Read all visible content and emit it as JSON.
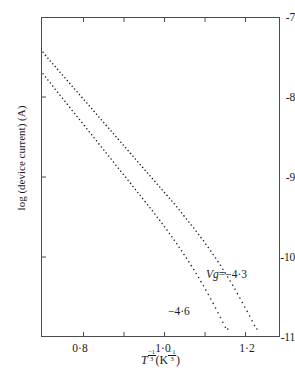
{
  "figure": {
    "background_color": "#ffffff",
    "ink_color": "#1a1a1a",
    "frame_color": "#4a4a4a"
  },
  "axes": {
    "y": {
      "title": "log (device current) (A)",
      "ticks": [
        "-7",
        "-8",
        "-9",
        "-10",
        "-11"
      ],
      "tick_values": [
        -7,
        -8,
        -9,
        -10,
        -11
      ],
      "limits": [
        -11,
        -7
      ]
    },
    "x": {
      "title_prefix": "T",
      "title_exp": "-1/3",
      "title_unit_open": "(K",
      "title_unit_exp": "-1/3",
      "title_unit_close": ")",
      "title_plain": "T^-1/3 (K^-1/3)",
      "ticks": [
        "0·8",
        "",
        "1·0",
        "",
        "1·2"
      ],
      "tick_values": [
        0.8,
        0.9,
        1.0,
        1.1,
        1.2
      ],
      "labeled": [
        true,
        false,
        true,
        false,
        true
      ],
      "limits": [
        0.695,
        1.285
      ]
    }
  },
  "annotations": [
    {
      "id": "vg43",
      "text": "Vg=−4·3",
      "var_part": "Vg",
      "rest": "=−4·3"
    },
    {
      "id": "vg46",
      "text": "−4·6",
      "var_part": "",
      "rest": "−4·6"
    }
  ],
  "chart_data": {
    "type": "scatter",
    "title": "",
    "xlabel": "T^-1/3 (K^-1/3)",
    "ylabel": "log (device current) (A)",
    "xlim": [
      0.695,
      1.285
    ],
    "ylim": [
      -11.0,
      -7.0
    ],
    "grid": false,
    "legend": "inline-annotations",
    "marker": "dot",
    "series": [
      {
        "name": "Vg=-4.3",
        "label": "Vg=−4·3",
        "comment": "upper-right curve; densely sampled dotted trace",
        "points": [
          [
            0.7,
            -7.44
          ],
          [
            0.706,
            -7.48
          ],
          [
            0.712,
            -7.515
          ],
          [
            0.718,
            -7.55
          ],
          [
            0.724,
            -7.585
          ],
          [
            0.73,
            -7.62
          ],
          [
            0.736,
            -7.655
          ],
          [
            0.742,
            -7.69
          ],
          [
            0.748,
            -7.725
          ],
          [
            0.754,
            -7.76
          ],
          [
            0.76,
            -7.795
          ],
          [
            0.766,
            -7.83
          ],
          [
            0.772,
            -7.865
          ],
          [
            0.778,
            -7.9
          ],
          [
            0.784,
            -7.935
          ],
          [
            0.79,
            -7.97
          ],
          [
            0.796,
            -8.005
          ],
          [
            0.802,
            -8.04
          ],
          [
            0.808,
            -8.075
          ],
          [
            0.814,
            -8.11
          ],
          [
            0.82,
            -8.145
          ],
          [
            0.826,
            -8.18
          ],
          [
            0.832,
            -8.215
          ],
          [
            0.838,
            -8.25
          ],
          [
            0.844,
            -8.285
          ],
          [
            0.85,
            -8.32
          ],
          [
            0.856,
            -8.355
          ],
          [
            0.862,
            -8.39
          ],
          [
            0.868,
            -8.425
          ],
          [
            0.874,
            -8.46
          ],
          [
            0.88,
            -8.495
          ],
          [
            0.886,
            -8.53
          ],
          [
            0.892,
            -8.565
          ],
          [
            0.898,
            -8.6
          ],
          [
            0.904,
            -8.635
          ],
          [
            0.91,
            -8.67
          ],
          [
            0.916,
            -8.705
          ],
          [
            0.922,
            -8.74
          ],
          [
            0.928,
            -8.775
          ],
          [
            0.934,
            -8.81
          ],
          [
            0.94,
            -8.845
          ],
          [
            0.946,
            -8.88
          ],
          [
            0.952,
            -8.915
          ],
          [
            0.958,
            -8.95
          ],
          [
            0.964,
            -8.985
          ],
          [
            0.97,
            -9.02
          ],
          [
            0.976,
            -9.055
          ],
          [
            0.982,
            -9.09
          ],
          [
            0.988,
            -9.125
          ],
          [
            0.994,
            -9.16
          ],
          [
            1.0,
            -9.195
          ],
          [
            1.006,
            -9.23
          ],
          [
            1.012,
            -9.265
          ],
          [
            1.018,
            -9.3
          ],
          [
            1.024,
            -9.335
          ],
          [
            1.03,
            -9.372
          ],
          [
            1.036,
            -9.41
          ],
          [
            1.042,
            -9.448
          ],
          [
            1.048,
            -9.486
          ],
          [
            1.054,
            -9.524
          ],
          [
            1.06,
            -9.562
          ],
          [
            1.066,
            -9.6
          ],
          [
            1.072,
            -9.638
          ],
          [
            1.078,
            -9.678
          ],
          [
            1.084,
            -9.718
          ],
          [
            1.09,
            -9.758
          ],
          [
            1.096,
            -9.798
          ],
          [
            1.102,
            -9.84
          ],
          [
            1.108,
            -9.882
          ],
          [
            1.114,
            -9.924
          ],
          [
            1.12,
            -9.968
          ],
          [
            1.126,
            -10.012
          ],
          [
            1.132,
            -10.058
          ],
          [
            1.138,
            -10.104
          ],
          [
            1.144,
            -10.152
          ],
          [
            1.15,
            -10.2
          ],
          [
            1.156,
            -10.25
          ],
          [
            1.162,
            -10.3
          ],
          [
            1.168,
            -10.352
          ],
          [
            1.174,
            -10.404
          ],
          [
            1.18,
            -10.458
          ],
          [
            1.186,
            -10.512
          ],
          [
            1.192,
            -10.568
          ],
          [
            1.198,
            -10.624
          ],
          [
            1.204,
            -10.68
          ],
          [
            1.21,
            -10.738
          ],
          [
            1.216,
            -10.796
          ],
          [
            1.222,
            -10.856
          ],
          [
            1.228,
            -10.9
          ]
        ]
      },
      {
        "name": "Vg=-4.6",
        "label": "−4·6",
        "comment": "lower-left curve; steeper, offset downward ~0.27 decades at left",
        "points": [
          [
            0.7,
            -7.71
          ],
          [
            0.706,
            -7.75
          ],
          [
            0.712,
            -7.788
          ],
          [
            0.718,
            -7.826
          ],
          [
            0.724,
            -7.864
          ],
          [
            0.73,
            -7.902
          ],
          [
            0.736,
            -7.94
          ],
          [
            0.742,
            -7.978
          ],
          [
            0.748,
            -8.016
          ],
          [
            0.754,
            -8.054
          ],
          [
            0.76,
            -8.092
          ],
          [
            0.766,
            -8.13
          ],
          [
            0.772,
            -8.168
          ],
          [
            0.778,
            -8.206
          ],
          [
            0.784,
            -8.244
          ],
          [
            0.79,
            -8.282
          ],
          [
            0.796,
            -8.32
          ],
          [
            0.802,
            -8.358
          ],
          [
            0.808,
            -8.396
          ],
          [
            0.814,
            -8.434
          ],
          [
            0.82,
            -8.472
          ],
          [
            0.826,
            -8.51
          ],
          [
            0.832,
            -8.548
          ],
          [
            0.838,
            -8.586
          ],
          [
            0.844,
            -8.624
          ],
          [
            0.85,
            -8.662
          ],
          [
            0.856,
            -8.7
          ],
          [
            0.862,
            -8.738
          ],
          [
            0.868,
            -8.776
          ],
          [
            0.874,
            -8.814
          ],
          [
            0.88,
            -8.852
          ],
          [
            0.886,
            -8.89
          ],
          [
            0.892,
            -8.928
          ],
          [
            0.898,
            -8.966
          ],
          [
            0.904,
            -9.004
          ],
          [
            0.91,
            -9.042
          ],
          [
            0.916,
            -9.08
          ],
          [
            0.922,
            -9.118
          ],
          [
            0.928,
            -9.156
          ],
          [
            0.934,
            -9.194
          ],
          [
            0.94,
            -9.232
          ],
          [
            0.946,
            -9.27
          ],
          [
            0.952,
            -9.308
          ],
          [
            0.958,
            -9.346
          ],
          [
            0.964,
            -9.384
          ],
          [
            0.97,
            -9.422
          ],
          [
            0.976,
            -9.462
          ],
          [
            0.982,
            -9.502
          ],
          [
            0.988,
            -9.542
          ],
          [
            0.994,
            -9.582
          ],
          [
            1.0,
            -9.622
          ],
          [
            1.006,
            -9.664
          ],
          [
            1.012,
            -9.706
          ],
          [
            1.018,
            -9.748
          ],
          [
            1.024,
            -9.79
          ],
          [
            1.03,
            -9.834
          ],
          [
            1.036,
            -9.878
          ],
          [
            1.042,
            -9.922
          ],
          [
            1.048,
            -9.968
          ],
          [
            1.054,
            -10.014
          ],
          [
            1.06,
            -10.06
          ],
          [
            1.066,
            -10.108
          ],
          [
            1.072,
            -10.156
          ],
          [
            1.078,
            -10.206
          ],
          [
            1.084,
            -10.256
          ],
          [
            1.09,
            -10.308
          ],
          [
            1.096,
            -10.36
          ],
          [
            1.102,
            -10.414
          ],
          [
            1.108,
            -10.468
          ],
          [
            1.114,
            -10.524
          ],
          [
            1.12,
            -10.58
          ],
          [
            1.126,
            -10.638
          ],
          [
            1.132,
            -10.696
          ],
          [
            1.138,
            -10.756
          ],
          [
            1.144,
            -10.816
          ],
          [
            1.15,
            -10.878
          ],
          [
            1.156,
            -10.9
          ]
        ]
      }
    ]
  }
}
